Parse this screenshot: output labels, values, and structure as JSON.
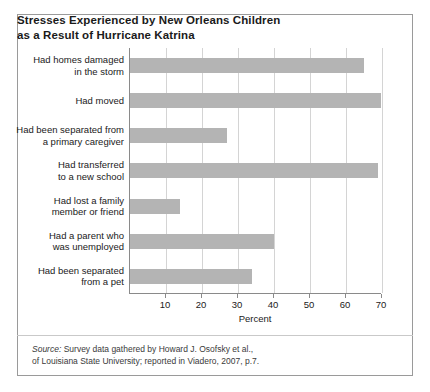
{
  "title": {
    "line1": "Stresses Experienced by New Orleans Children",
    "line2": "as a Result of Hurricane Katrina"
  },
  "chart_data": {
    "type": "bar",
    "orientation": "horizontal",
    "title": "Stresses Experienced by New Orleans Children as a Result of Hurricane Katrina",
    "xlabel": "Percent",
    "ylabel": "",
    "xlim": [
      0,
      70
    ],
    "xticks": [
      10,
      20,
      30,
      40,
      50,
      60,
      70
    ],
    "xtick_labels": [
      "10",
      "20",
      "30",
      "40",
      "50",
      "60",
      "70"
    ],
    "grid": "vertical",
    "legend": "none",
    "bar_color": "#b4b4b4",
    "categories": [
      "Had homes damaged\nin the storm",
      "Had moved",
      "Had been separated from\na primary caregiver",
      "Had transferred\nto a new school",
      "Had lost a family\nmember or friend",
      "Had a parent who\nwas unemployed",
      "Had been separated\nfrom a pet"
    ],
    "values": [
      65,
      70,
      27,
      69,
      14,
      40,
      34
    ]
  },
  "source": {
    "label": "Source:",
    "line1": " Survey data gathered by Howard J. Osofsky et al.,",
    "line2": "of Louisiana State University; reported in Viadero, 2007, p.7."
  }
}
